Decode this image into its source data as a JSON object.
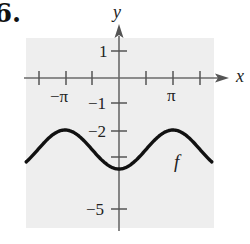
{
  "problem": {
    "number_label": "6."
  },
  "chart_data": {
    "type": "line",
    "title": "",
    "xlabel": "x",
    "ylabel": "y",
    "function_label": "f",
    "function": "f(x) = -2.75 - 0.75 cos(x)",
    "x_tick_labels": [
      "−π",
      "π"
    ],
    "x_tick_positions": [
      -4.712,
      -3.1416,
      -1.5708,
      1.5708,
      3.1416,
      4.712
    ],
    "y_tick_labels": [
      "1",
      "−1",
      "−2",
      "−5"
    ],
    "y_tick_positions": [
      1,
      -1,
      -2,
      -3,
      -5
    ],
    "xlim": [
      -5.4,
      5.4
    ],
    "ylim": [
      -5.8,
      1.5
    ],
    "grid": false,
    "background": "#eeeeee",
    "series": [
      {
        "name": "f",
        "x": [
          -5.4,
          -4.712,
          -3.1416,
          -1.5708,
          0,
          1.5708,
          3.1416,
          4.712,
          5.4
        ],
        "y": [
          -3.23,
          -2.75,
          -2.0,
          -2.75,
          -3.5,
          -2.75,
          -2.0,
          -2.75,
          -3.23
        ]
      }
    ],
    "extrema": {
      "max": -2,
      "max_at": [
        "−π",
        "π"
      ],
      "min": -3.5,
      "min_at": 0
    }
  },
  "labels": {
    "x_axis": "x",
    "y_axis": "y",
    "x_neg_pi": "−π",
    "x_pi": "π",
    "y_1": "1",
    "y_neg1": "−1",
    "y_neg2": "−2",
    "y_neg5": "−5",
    "function": "f"
  }
}
